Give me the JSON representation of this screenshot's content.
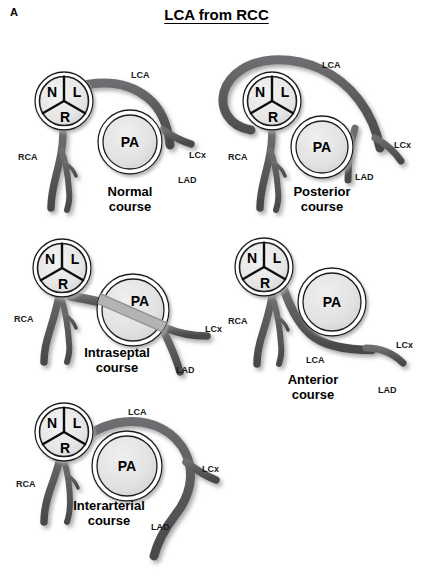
{
  "figure": {
    "panel_label": "A",
    "title": "LCA from RCC"
  },
  "colors": {
    "background": "#ffffff",
    "vessel": "#58595b",
    "vessel_dark": "#4a4b4d",
    "vessel_shadow": "#b9babc",
    "ring_outline": "#1a1a1a",
    "root_fill": "#e8e8e8",
    "pa_fill": "#e4e4e4",
    "septal_band": "#b0b0b0",
    "text": "#000000"
  },
  "cusp_labels": {
    "non_coronary": "N",
    "left": "L",
    "right": "R"
  },
  "pa_label": "PA",
  "vessel_labels": {
    "lca": "LCA",
    "lcx": "LCx",
    "lad": "LAD",
    "rca": "RCA"
  },
  "panels": [
    {
      "id": "normal",
      "caption_line1": "Normal",
      "caption_line2": "course",
      "labels": {
        "lca": "LCA",
        "lcx": "LCx",
        "lad": "LAD",
        "rca": "RCA",
        "pa": "PA",
        "n": "N",
        "l": "L",
        "r": "R"
      }
    },
    {
      "id": "posterior",
      "caption_line1": "Posterior",
      "caption_line2": "course",
      "labels": {
        "lca": "LCA",
        "lcx": "LCx",
        "lad": "LAD",
        "rca": "RCA",
        "pa": "PA",
        "n": "N",
        "l": "L",
        "r": "R"
      }
    },
    {
      "id": "intraseptal",
      "caption_line1": "Intraseptal",
      "caption_line2": "course",
      "labels": {
        "lcx": "LCx",
        "lad": "LAD",
        "rca": "RCA",
        "pa": "PA",
        "n": "N",
        "l": "L",
        "r": "R"
      }
    },
    {
      "id": "anterior",
      "caption_line1": "Anterior",
      "caption_line2": "course",
      "labels": {
        "lca": "LCA",
        "lcx": "LCx",
        "lad": "LAD",
        "rca": "RCA",
        "pa": "PA",
        "n": "N",
        "l": "L",
        "r": "R"
      }
    },
    {
      "id": "interarterial",
      "caption_line1": "Interarterial",
      "caption_line2": "course",
      "labels": {
        "lca": "LCA",
        "lcx": "LCx",
        "lad": "LAD",
        "rca": "RCA",
        "pa": "PA",
        "n": "N",
        "l": "L",
        "r": "R"
      }
    }
  ]
}
